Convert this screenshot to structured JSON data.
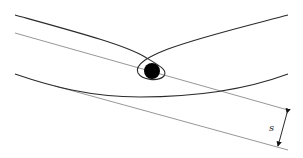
{
  "diagram": {
    "central_body": {
      "shape": "filled-circle",
      "color": "#000000"
    },
    "labels": {
      "impact_parameter": "s"
    },
    "colors": {
      "trajectory": "#2a2a2a",
      "asymptote": "#6a6a6a",
      "background": "#ffffff"
    }
  }
}
